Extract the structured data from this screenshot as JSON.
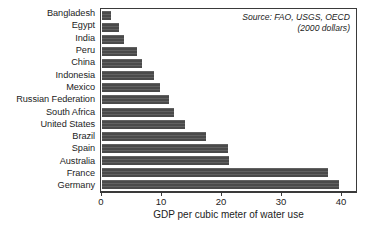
{
  "chart_data": {
    "type": "bar",
    "orientation": "horizontal",
    "title": "",
    "xlabel": "GDP per cubic meter of water use",
    "ylabel": "",
    "xlim": [
      0,
      42.5
    ],
    "xticks": [
      0,
      10,
      20,
      30,
      40
    ],
    "xtick_labels": [
      "0",
      "10",
      "20",
      "30",
      "40"
    ],
    "grid": false,
    "legend": null,
    "categories": [
      "Bangladesh",
      "Egypt",
      "India",
      "Peru",
      "China",
      "Indonesia",
      "Mexico",
      "Russian Federation",
      "South Africa",
      "United States",
      "Brazil",
      "Spain",
      "Australia",
      "France",
      "Germany"
    ],
    "values": [
      1.5,
      2.8,
      3.6,
      5.9,
      6.6,
      8.6,
      9.6,
      11.2,
      12.0,
      13.8,
      17.4,
      21.0,
      21.2,
      37.7,
      39.5
    ],
    "bar_color": "#4a4a4a",
    "annotations": [
      "Source: FAO, USGS, OECD",
      "(2000 dollars)"
    ]
  },
  "source_note": {
    "line1": "Source: FAO, USGS, OECD",
    "line2": "(2000 dollars)"
  },
  "axis": {
    "x_title": "GDP per cubic meter of water use"
  },
  "caption": {
    "text": ""
  }
}
